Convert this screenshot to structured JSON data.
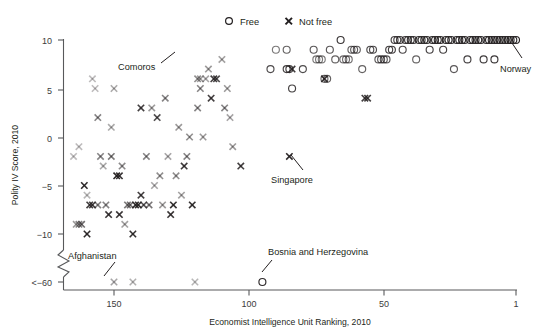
{
  "chart_data": {
    "type": "scatter",
    "title": "",
    "xlabel": "Economist Intelligence Unit Ranking, 2010",
    "ylabel": "Polity IV Score, 2010",
    "xlim": [
      167,
      1
    ],
    "ylim": [
      -60,
      10
    ],
    "x_reversed": true,
    "grid": false,
    "axis_break": {
      "present": true,
      "between": [
        -10,
        -60
      ],
      "label": "<−60"
    },
    "xticks": [
      150,
      100,
      50,
      1
    ],
    "xtick_labels": [
      "150",
      "100",
      "50",
      "1"
    ],
    "yticks": [
      10,
      5,
      0,
      -5,
      -10,
      -60
    ],
    "ytick_labels": [
      "10",
      "5",
      "0",
      "−5",
      "−10",
      "<−60"
    ],
    "legend": {
      "position": "top-center",
      "entries": [
        {
          "name": "Free",
          "marker": "circle",
          "color": "#231f20"
        },
        {
          "name": "Not free",
          "marker": "x",
          "color": "#231f20"
        }
      ]
    },
    "annotations": [
      {
        "text": "Comoros",
        "point_x": 146,
        "point_y": 8.6,
        "label_x": 134,
        "label_y": 7.6
      },
      {
        "text": "Norway",
        "point_x": 1,
        "point_y": 10,
        "label_x": 6,
        "label_y": 7.2
      },
      {
        "text": "Singapore",
        "point_x": 85,
        "point_y": -2,
        "label_x": 78,
        "label_y": -4.6
      },
      {
        "text": "Afghanistan",
        "point_x": 150,
        "point_y": -60,
        "label_x": 158,
        "label_y": -43
      },
      {
        "text": "Bosnia and Herzegovina",
        "point_x": 95,
        "point_y": -60,
        "label_x": 88,
        "label_y": -40
      }
    ],
    "series": [
      {
        "name": "Not free",
        "marker": "x",
        "points": [
          [
            165,
            -2,
            0.3
          ],
          [
            163,
            -1,
            0.3
          ],
          [
            164,
            -9,
            0.45
          ],
          [
            163,
            -9,
            0.55
          ],
          [
            162,
            -9,
            0.65
          ],
          [
            161,
            -5,
            0.95
          ],
          [
            160,
            -10,
            0.95
          ],
          [
            160,
            -6,
            0.32
          ],
          [
            159,
            -7,
            0.85
          ],
          [
            158,
            -7,
            0.85
          ],
          [
            158,
            6,
            0.3
          ],
          [
            157,
            5,
            0.3
          ],
          [
            156,
            -7,
            0.55
          ],
          [
            156,
            2,
            0.55
          ],
          [
            155,
            -2,
            0.55
          ],
          [
            154,
            -3,
            0.38
          ],
          [
            153,
            -7,
            0.55
          ],
          [
            152,
            -8,
            0.9
          ],
          [
            151,
            -2,
            0.6
          ],
          [
            151,
            1,
            0.38
          ],
          [
            150,
            -60,
            0.4
          ],
          [
            150,
            5,
            0.38
          ],
          [
            149,
            -4,
            0.95
          ],
          [
            148,
            -4,
            0.9
          ],
          [
            148,
            -8,
            0.9
          ],
          [
            147,
            -3,
            0.52
          ],
          [
            146,
            -9,
            0.42
          ],
          [
            145,
            -7,
            0.6
          ],
          [
            144,
            -7,
            0.62
          ],
          [
            143,
            -10,
            0.92
          ],
          [
            143,
            -60,
            0.35
          ],
          [
            142,
            -7,
            0.92
          ],
          [
            141,
            -7,
            0.92
          ],
          [
            140,
            3,
            0.85
          ],
          [
            140,
            -6,
            0.85
          ],
          [
            139,
            -7,
            0.75
          ],
          [
            138,
            -2,
            0.55
          ],
          [
            137,
            -7,
            0.62
          ],
          [
            136,
            3,
            0.45
          ],
          [
            135,
            -5,
            0.4
          ],
          [
            134,
            2,
            0.8
          ],
          [
            133,
            -4,
            0.5
          ],
          [
            132,
            -7,
            0.45
          ],
          [
            131,
            4,
            0.55
          ],
          [
            130,
            -2,
            0.4
          ],
          [
            129,
            -8,
            0.9
          ],
          [
            128,
            -7,
            0.92
          ],
          [
            127,
            -4,
            0.5
          ],
          [
            126,
            1,
            0.45
          ],
          [
            125,
            -6,
            0.42
          ],
          [
            124,
            -3,
            0.88
          ],
          [
            123,
            -2,
            0.55
          ],
          [
            122,
            0,
            0.5
          ],
          [
            121,
            -7,
            0.92
          ],
          [
            120,
            -60,
            0.32
          ],
          [
            119,
            3,
            0.55
          ],
          [
            119,
            6,
            0.5
          ],
          [
            118,
            5,
            0.55
          ],
          [
            118,
            6,
            0.42
          ],
          [
            117,
            0,
            0.45
          ],
          [
            116,
            6,
            0.4
          ],
          [
            115,
            7,
            0.45
          ],
          [
            114,
            4,
            0.85
          ],
          [
            113,
            6,
            0.85
          ],
          [
            112,
            6,
            0.8
          ],
          [
            110,
            8,
            0.42
          ],
          [
            109,
            3,
            0.55
          ],
          [
            108,
            5,
            0.45
          ],
          [
            107,
            2,
            0.4
          ],
          [
            106,
            -1,
            0.45
          ],
          [
            103,
            -3,
            0.85
          ],
          [
            85,
            -2,
            0.95
          ],
          [
            84,
            7,
            0.88
          ],
          [
            72,
            6,
            0.9
          ],
          [
            57,
            4,
            0.85
          ],
          [
            56,
            4,
            0.85
          ]
        ]
      },
      {
        "name": "Free",
        "marker": "circle",
        "points": [
          [
            95,
            -60,
            0.95
          ],
          [
            92,
            7,
            0.8
          ],
          [
            90,
            9,
            0.6
          ],
          [
            86,
            9,
            0.7
          ],
          [
            86,
            7,
            0.85
          ],
          [
            85,
            7,
            0.85
          ],
          [
            84,
            5,
            0.85
          ],
          [
            80,
            7,
            0.8
          ],
          [
            76,
            9,
            0.75
          ],
          [
            75,
            8,
            0.6
          ],
          [
            74,
            8,
            0.6
          ],
          [
            73,
            8,
            0.6
          ],
          [
            72,
            6,
            0.7
          ],
          [
            71,
            6,
            0.7
          ],
          [
            70,
            9,
            0.75
          ],
          [
            68,
            8,
            0.7
          ],
          [
            66,
            10,
            0.9
          ],
          [
            65,
            8,
            0.65
          ],
          [
            64,
            8,
            0.65
          ],
          [
            63,
            8,
            0.65
          ],
          [
            62,
            9,
            0.72
          ],
          [
            61,
            9,
            0.72
          ],
          [
            60,
            9,
            0.72
          ],
          [
            58,
            7,
            0.7
          ],
          [
            55,
            9,
            0.8
          ],
          [
            54,
            9,
            0.8
          ],
          [
            52,
            8,
            0.75
          ],
          [
            51,
            8,
            0.75
          ],
          [
            50,
            8,
            0.75
          ],
          [
            49,
            8,
            0.75
          ],
          [
            48,
            9,
            0.85
          ],
          [
            47,
            9,
            0.85
          ],
          [
            46,
            10,
            0.85
          ],
          [
            45,
            10,
            0.85
          ],
          [
            44,
            10,
            0.88
          ],
          [
            43,
            9,
            0.82
          ],
          [
            42,
            10,
            0.88
          ],
          [
            41,
            10,
            0.88
          ],
          [
            40,
            10,
            0.9
          ],
          [
            39,
            10,
            0.9
          ],
          [
            38,
            8,
            0.7
          ],
          [
            37,
            10,
            0.92
          ],
          [
            36,
            10,
            0.92
          ],
          [
            35,
            10,
            0.92
          ],
          [
            34,
            10,
            0.92
          ],
          [
            33,
            9,
            0.85
          ],
          [
            32,
            10,
            0.94
          ],
          [
            31,
            10,
            0.94
          ],
          [
            30,
            10,
            0.94
          ],
          [
            29,
            10,
            0.94
          ],
          [
            28,
            9,
            0.85
          ],
          [
            27,
            10,
            0.95
          ],
          [
            26,
            10,
            0.95
          ],
          [
            25,
            10,
            0.95
          ],
          [
            24,
            7,
            0.75
          ],
          [
            23,
            10,
            0.95
          ],
          [
            22,
            10,
            0.95
          ],
          [
            21,
            10,
            0.95
          ],
          [
            20,
            10,
            0.95
          ],
          [
            19,
            8,
            0.85
          ],
          [
            18,
            10,
            0.95
          ],
          [
            17,
            10,
            0.95
          ],
          [
            16,
            10,
            0.95
          ],
          [
            15,
            10,
            0.96
          ],
          [
            14,
            10,
            0.96
          ],
          [
            13,
            8,
            0.88
          ],
          [
            12,
            10,
            0.96
          ],
          [
            11,
            10,
            0.96
          ],
          [
            10,
            10,
            0.96
          ],
          [
            9,
            8,
            0.9
          ],
          [
            9,
            10,
            0.96
          ],
          [
            8,
            10,
            0.96
          ],
          [
            7,
            10,
            0.96
          ],
          [
            6,
            10,
            0.96
          ],
          [
            5,
            10,
            0.96
          ],
          [
            4,
            10,
            0.97
          ],
          [
            3,
            10,
            0.97
          ],
          [
            2,
            10,
            0.97
          ],
          [
            1,
            10,
            0.98
          ]
        ]
      }
    ]
  },
  "legend": {
    "free_label": "Free",
    "notfree_label": "Not free"
  },
  "axes": {
    "x_title": "Economist Intelligence Unit Ranking, 2010",
    "y_title": "Polity IV Score, 2010",
    "xtick_150": "150",
    "xtick_100": "100",
    "xtick_50": "50",
    "xtick_1": "1",
    "ytick_10": "10",
    "ytick_5": "5",
    "ytick_0": "0",
    "ytick_m5": "−5",
    "ytick_m10": "−10",
    "ytick_m60": "<−60"
  },
  "annotations": {
    "comoros": "Comoros",
    "norway": "Norway",
    "singapore": "Singapore",
    "afghanistan": "Afghanistan",
    "bosnia": "Bosnia and Herzegovina"
  },
  "colors": {
    "marker": "#231f20",
    "axis": "#58595b",
    "text": "#231f20"
  }
}
